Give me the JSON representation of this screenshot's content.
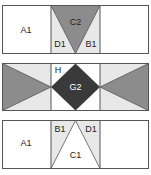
{
  "colors": {
    "border": "#555555",
    "white": "#ffffff",
    "light_grey": "#e8e8e8",
    "medium_grey": "#8c8c8c",
    "dark_grey": "#3a3a3a"
  },
  "blocks": [
    {
      "name": "top-block",
      "labels": {
        "left": "A1",
        "center_triangle": "C2",
        "center_left": "D1",
        "center_right": "B1"
      }
    },
    {
      "name": "middle-block",
      "labels": {
        "center_corner": "H",
        "center_diamond": "G2"
      }
    },
    {
      "name": "bottom-block",
      "labels": {
        "left": "A1",
        "center_left": "B1",
        "center_right": "D1",
        "center_triangle": "C1"
      }
    }
  ]
}
